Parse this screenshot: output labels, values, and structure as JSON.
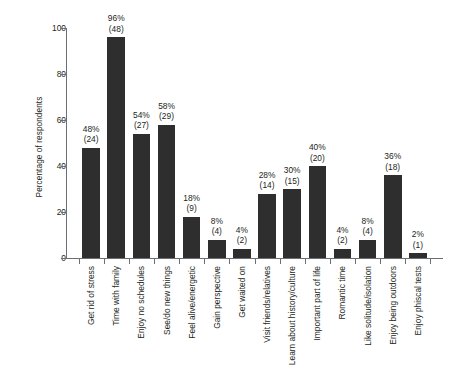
{
  "chart_data": {
    "type": "bar",
    "title": "",
    "xlabel": "",
    "ylabel": "Percentage of respondents",
    "ylim": [
      0,
      100
    ],
    "yticks": [
      0,
      20,
      40,
      60,
      80,
      100
    ],
    "grid": false,
    "legend": null,
    "bar_color": "#2e2e2e",
    "axis_color": "#6d6e71",
    "categories": [
      "Get rid of stress",
      "Time with family",
      "Enjoy no schedules",
      "See/do new things",
      "Feel alive/energetic",
      "Gain perspective",
      "Get waited on",
      "Visit friends/relatives",
      "Learn about history/culture",
      "Important part of life",
      "Romantic time",
      "Like solitude/isolation",
      "Enjoy being outdoors",
      "Enjoy phiscal tests"
    ],
    "values": [
      48,
      96,
      54,
      58,
      18,
      8,
      4,
      28,
      30,
      40,
      4,
      8,
      36,
      2
    ],
    "counts": [
      24,
      48,
      27,
      29,
      9,
      4,
      2,
      14,
      15,
      20,
      2,
      4,
      18,
      1
    ],
    "bar_labels": [
      {
        "percent": "48%",
        "count": "(24)"
      },
      {
        "percent": "96%",
        "count": "(48)"
      },
      {
        "percent": "54%",
        "count": "(27)"
      },
      {
        "percent": "58%",
        "count": "(29)"
      },
      {
        "percent": "18%",
        "count": "(9)"
      },
      {
        "percent": "8%",
        "count": "(4)"
      },
      {
        "percent": "4%",
        "count": "(2)"
      },
      {
        "percent": "28%",
        "count": "(14)"
      },
      {
        "percent": "30%",
        "count": "(15)"
      },
      {
        "percent": "40%",
        "count": "(20)"
      },
      {
        "percent": "4%",
        "count": "(2)"
      },
      {
        "percent": "8%",
        "count": "(4)"
      },
      {
        "percent": "36%",
        "count": "(18)"
      },
      {
        "percent": "2%",
        "count": "(1)"
      }
    ]
  }
}
